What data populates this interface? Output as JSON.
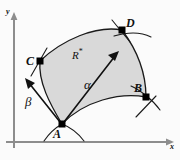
{
  "figure": {
    "background_color": "#fbfbfb",
    "region_fill_color": "#d9d9d9",
    "outline_color": "#1a1a1a",
    "axis_color": "#8d8d8d"
  },
  "axes": {
    "x_label": "x",
    "y_label": "y",
    "origin": {
      "x": 14,
      "y": 142
    }
  },
  "region": {
    "label": "R",
    "superscript": "*",
    "label_full": "R*"
  },
  "vertices": [
    {
      "id": "A",
      "label": "A",
      "x": 62,
      "y": 124
    },
    {
      "id": "B",
      "label": "B",
      "x": 146,
      "y": 97
    },
    {
      "id": "C",
      "label": "C",
      "x": 40,
      "y": 61
    },
    {
      "id": "D",
      "label": "D",
      "x": 122,
      "y": 30
    }
  ],
  "vectors": [
    {
      "id": "alpha",
      "label": "α",
      "from": "A",
      "direction": "up-right"
    },
    {
      "id": "beta",
      "label": "β",
      "from": "A",
      "direction": "up-left"
    }
  ]
}
